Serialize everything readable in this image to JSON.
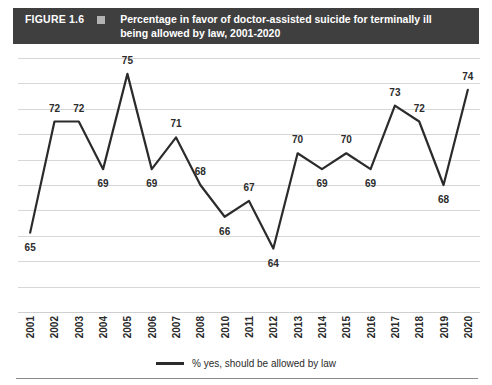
{
  "header": {
    "figure_number": "FIGURE 1.6",
    "marker_icon": "square-marker-icon",
    "title": "Percentage in favor of doctor-assisted suicide for terminally ill being allowed by law, 2001-2020"
  },
  "legend": {
    "label": "% yes, should be allowed by law",
    "line_color": "#2b2b2b"
  },
  "colors": {
    "header_background": "#3f3f3f",
    "header_text": "#ffffff",
    "header_square": "#b3b3b3",
    "series_line": "#2b2b2b",
    "gridline": "#d7d7d7",
    "label_text": "#2b2b2b"
  },
  "chart_data": {
    "type": "line",
    "title": "Percentage in favor of doctor-assisted suicide for terminally ill being allowed by law, 2001-2020",
    "xlabel": "",
    "ylabel": "",
    "categories": [
      "2001",
      "2002",
      "2003",
      "2004",
      "2005",
      "2006",
      "2007",
      "2008",
      "2010",
      "2011",
      "2012",
      "2013",
      "2014",
      "2015",
      "2016",
      "2017",
      "2018",
      "2019",
      "2020"
    ],
    "values": [
      65,
      72,
      72,
      69,
      75,
      69,
      71,
      68,
      66,
      67,
      64,
      70,
      69,
      70,
      69,
      73,
      72,
      68,
      74
    ],
    "series": [
      {
        "name": "% yes, should be allowed by law",
        "values": [
          65,
          72,
          72,
          69,
          75,
          69,
          71,
          68,
          66,
          67,
          64,
          70,
          69,
          70,
          69,
          73,
          72,
          68,
          74
        ]
      }
    ],
    "data_labels": [
      "65",
      "72",
      "72",
      "69",
      "75",
      "69",
      "71",
      "68",
      "66",
      "67",
      "64",
      "70",
      "69",
      "70",
      "69",
      "73",
      "72",
      "68",
      "74"
    ],
    "ylim": [
      60,
      76
    ],
    "grid": true,
    "gridline_count": 11,
    "y_tick_labels": [],
    "legend_position": "bottom",
    "note": "Year 2009 is absent from the horizontal axis; 19 data points span 2001-2008 and 2010-2020."
  }
}
